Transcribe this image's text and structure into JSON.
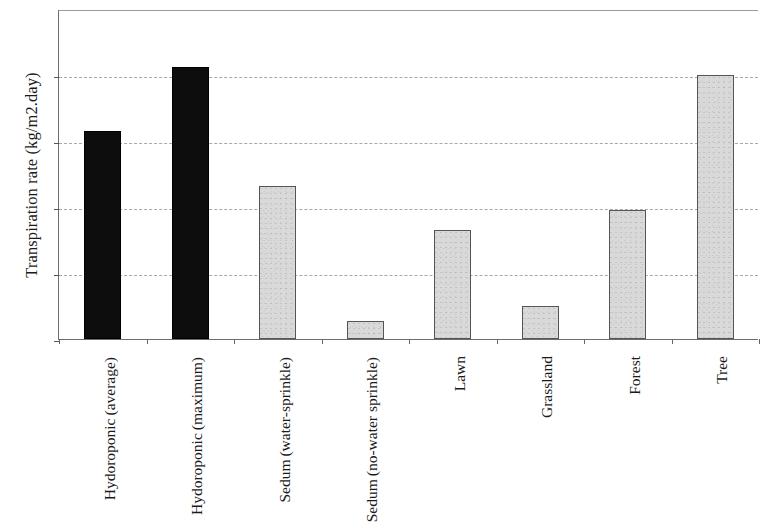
{
  "chart_data": {
    "type": "bar",
    "title": "",
    "xlabel": "",
    "ylabel": "Transpiration rate (kg/m2.day)",
    "ylim": [
      0,
      10
    ],
    "yticks": [
      0,
      2,
      4,
      6,
      8,
      10
    ],
    "ytick_labels": [
      "0",
      "2",
      "4",
      "6",
      "8",
      "10"
    ],
    "grid": "horizontal-dashed",
    "legend": "none",
    "categories": [
      "Hydoroponic (average)",
      "Hydoroponic (maximum)",
      "Sedum (water-sprinkle)",
      "Sedum (no-water sprinkle)",
      "Lawn",
      "Grassland",
      "Forest",
      "Tree"
    ],
    "category_lines": [
      [
        "Hydoroponic",
        "(average)"
      ],
      [
        "Hydoroponic",
        "(maximum)"
      ],
      [
        "Sedum",
        "(water-sprinkle)"
      ],
      [
        "Sedum",
        "(no-water sprinkle)"
      ],
      [
        "Lawn"
      ],
      [
        "Grassland"
      ],
      [
        "Forest"
      ],
      [
        "Tree"
      ]
    ],
    "values": [
      6.3,
      8.25,
      4.65,
      0.55,
      3.3,
      1.0,
      3.9,
      8.0
    ],
    "bar_colors": [
      "#0d0d0d",
      "#0d0d0d",
      "#d9d9d9",
      "#d9d9d9",
      "#d9d9d9",
      "#d9d9d9",
      "#d9d9d9",
      "#d9d9d9"
    ],
    "bar_styles": [
      "dark",
      "dark",
      "light",
      "light",
      "light",
      "light",
      "light",
      "light"
    ],
    "colors": {
      "dark_fill": "#0d0d0d",
      "light_fill": "#d9d9d9",
      "light_edge": "#555555",
      "axis": "#6d6d6d",
      "gridline": "#a8a8a8",
      "text": "#1a1a1a",
      "background": "#ffffff"
    }
  }
}
